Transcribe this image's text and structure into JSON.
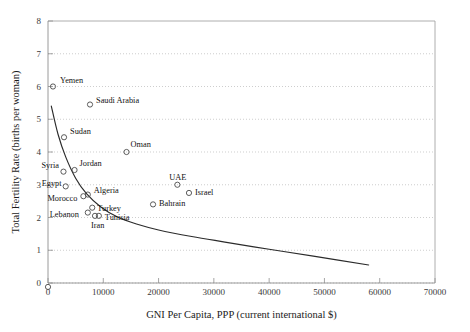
{
  "chart_data": {
    "type": "scatter",
    "title": "",
    "xlabel": "GNI Per Capita, PPP (current international $)",
    "ylabel": "Total Fertility Rate (births per woman)",
    "xlim": [
      0,
      70000
    ],
    "ylim": [
      0,
      8
    ],
    "xticks": [
      0,
      10000,
      20000,
      30000,
      40000,
      50000,
      60000,
      70000
    ],
    "yticks": [
      0,
      1,
      2,
      3,
      4,
      5,
      6,
      7,
      8
    ],
    "xtick_labels": [
      "0",
      "10000",
      "20000",
      "30000",
      "40000",
      "50000",
      "60000",
      "70000"
    ],
    "ytick_labels": [
      "0",
      "1",
      "2",
      "3",
      "4",
      "5",
      "6",
      "7",
      "8"
    ],
    "grid": "horizontal-dotted",
    "legend": "none",
    "marker_style": "open-circle",
    "points": [
      {
        "label": "Yemen",
        "x": 900,
        "y": 6.0,
        "label_dx": 7,
        "label_dy": -4
      },
      {
        "label": "Saudi Arabia",
        "x": 7600,
        "y": 5.45,
        "label_dx": 6,
        "label_dy": -2
      },
      {
        "label": "Sudan",
        "x": 2900,
        "y": 4.45,
        "label_dx": 6,
        "label_dy": -3
      },
      {
        "label": "Oman",
        "x": 14200,
        "y": 4.0,
        "label_dx": 4,
        "label_dy": -5
      },
      {
        "label": "Syria",
        "x": 2800,
        "y": 3.4,
        "label_dx": -22,
        "label_dy": -4
      },
      {
        "label": "Jordan",
        "x": 4800,
        "y": 3.45,
        "label_dx": 5,
        "label_dy": -4
      },
      {
        "label": "Egypt",
        "x": 3200,
        "y": 2.95,
        "label_dx": -24,
        "label_dy": 0
      },
      {
        "label": "UAE",
        "x": 23400,
        "y": 3.0,
        "label_dx": -8,
        "label_dy": -5
      },
      {
        "label": "Algeria",
        "x": 7200,
        "y": 2.7,
        "label_dx": 6,
        "label_dy": -2
      },
      {
        "label": "Israel",
        "x": 25500,
        "y": 2.75,
        "label_dx": 6,
        "label_dy": 2
      },
      {
        "label": "Morocco",
        "x": 6400,
        "y": 2.65,
        "label_dx": -36,
        "label_dy": 5
      },
      {
        "label": "Bahrain",
        "x": 19000,
        "y": 2.4,
        "label_dx": 6,
        "label_dy": 2
      },
      {
        "label": "Turkey",
        "x": 8000,
        "y": 2.3,
        "label_dx": 5,
        "label_dy": 3
      },
      {
        "label": "Lebanon",
        "x": 7200,
        "y": 2.15,
        "label_dx": -38,
        "label_dy": 4
      },
      {
        "label": "Iran",
        "x": 8500,
        "y": 2.05,
        "label_dx": -4,
        "label_dy": 12
      },
      {
        "label": "Tunisia",
        "x": 9200,
        "y": 2.05,
        "label_dx": 6,
        "label_dy": 4
      }
    ],
    "trend_line": {
      "description": "Fitted declining curve from low income high fertility to high income low fertility",
      "points": [
        {
          "x": 600,
          "y": 5.4
        },
        {
          "x": 1800,
          "y": 4.55
        },
        {
          "x": 3200,
          "y": 3.85
        },
        {
          "x": 5000,
          "y": 3.2
        },
        {
          "x": 7000,
          "y": 2.72
        },
        {
          "x": 9500,
          "y": 2.33
        },
        {
          "x": 12500,
          "y": 2.02
        },
        {
          "x": 16000,
          "y": 1.8
        },
        {
          "x": 20000,
          "y": 1.62
        },
        {
          "x": 26000,
          "y": 1.42
        },
        {
          "x": 32000,
          "y": 1.25
        },
        {
          "x": 40000,
          "y": 1.03
        },
        {
          "x": 48000,
          "y": 0.82
        },
        {
          "x": 58000,
          "y": 0.55
        }
      ]
    },
    "extra_markers": [
      {
        "x": 0,
        "y": -0.12,
        "note": "marker below origin"
      }
    ]
  }
}
